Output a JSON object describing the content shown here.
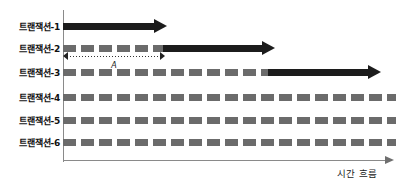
{
  "figure": {
    "axis": {
      "time_caption": "시간 흐름",
      "origin_x": 63,
      "baseline_y": 160,
      "axis_end_x": 394
    },
    "rows": [
      {
        "label": "트랜잭션-1",
        "y": 19,
        "label_right": 60,
        "segments": [
          {
            "kind": "solid",
            "start": 63,
            "end": 154
          }
        ],
        "arrow_at": 154
      },
      {
        "label": "트랜잭션-2",
        "y": 41,
        "label_right": 60,
        "segments": [
          {
            "kind": "dashed",
            "start": 63,
            "end": 163
          },
          {
            "kind": "solid",
            "start": 163,
            "end": 262
          }
        ],
        "arrow_at": 262
      },
      {
        "label": "트랜잭션-3",
        "y": 65,
        "label_right": 60,
        "segments": [
          {
            "kind": "dashed",
            "start": 63,
            "end": 268
          },
          {
            "kind": "solid",
            "start": 268,
            "end": 368
          }
        ],
        "arrow_at": 368
      },
      {
        "label": "트랜잭션-4",
        "y": 90,
        "label_right": 60,
        "segments": [
          {
            "kind": "dashed",
            "start": 63,
            "end": 396
          }
        ],
        "arrow_at": null
      },
      {
        "label": "트랜잭션-5",
        "y": 113,
        "label_right": 60,
        "segments": [
          {
            "kind": "dashed",
            "start": 63,
            "end": 396
          }
        ],
        "arrow_at": null
      },
      {
        "label": "트랜잭션-6",
        "y": 135,
        "label_right": 60,
        "segments": [
          {
            "kind": "dashed",
            "start": 63,
            "end": 396
          }
        ],
        "arrow_at": null
      }
    ],
    "interval_annotation": {
      "label": "A",
      "start": 63,
      "end": 165,
      "y": 52
    },
    "colors": {
      "active_bar": "#1c1c1c",
      "idle_dash": "#6b6b6b",
      "axis": "#8a8a8a",
      "text": "#111111",
      "background": "#ffffff"
    }
  }
}
